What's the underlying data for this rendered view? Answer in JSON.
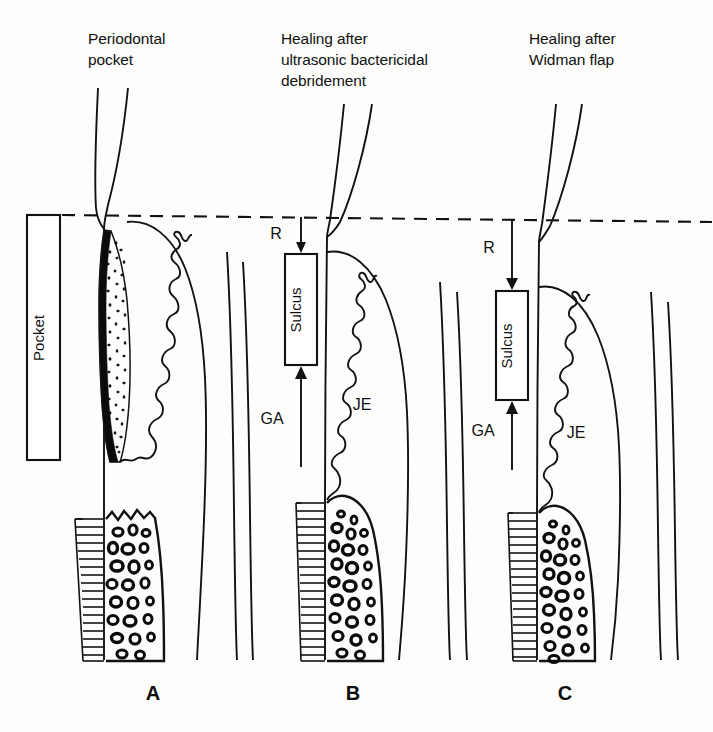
{
  "figure": {
    "kind": "dental-periodontal-healing-diagram",
    "background_color": "#fdfdfc",
    "ink_color": "#121212",
    "reference_line_label": "cemento-enamel-junction-reference-dashed-line"
  },
  "panels": [
    {
      "id": "A",
      "letter": "A",
      "title_lines": [
        "Periodontal",
        "pocket"
      ],
      "labels": {
        "pocket_box": "Pocket"
      },
      "features": [
        "periodontal-pocket",
        "inflammatory-infiltrate-stippling",
        "ulcerated-pocket-wall",
        "rete-peg-epithelium",
        "alveolar-bone-loss",
        "trabecular-bone",
        "periodontal-ligament-hatching"
      ]
    },
    {
      "id": "B",
      "letter": "B",
      "title_lines": [
        "Healing after",
        "ultrasonic bactericidal",
        "debridement"
      ],
      "labels": {
        "recession": "R",
        "sulcus_box": "Sulcus",
        "gain_of_attachment": "GA",
        "junctional_epithelium": "JE"
      },
      "features": [
        "shallow-recession",
        "restored-sulcus",
        "long-junctional-epithelium",
        "gain-of-attachment",
        "trabecular-bone",
        "periodontal-ligament-hatching"
      ]
    },
    {
      "id": "C",
      "letter": "C",
      "title_lines": [
        "Healing after",
        "Widman flap"
      ],
      "labels": {
        "recession": "R",
        "sulcus_box": "Sulcus",
        "gain_of_attachment": "GA",
        "junctional_epithelium": "JE"
      },
      "features": [
        "greater-recession",
        "restored-sulcus",
        "long-junctional-epithelium",
        "gain-of-attachment",
        "trabecular-bone",
        "periodontal-ligament-hatching"
      ]
    }
  ],
  "legend_terms": {
    "R": "R",
    "GA": "GA",
    "JE": "JE",
    "Sulcus": "Sulcus",
    "Pocket": "Pocket"
  }
}
